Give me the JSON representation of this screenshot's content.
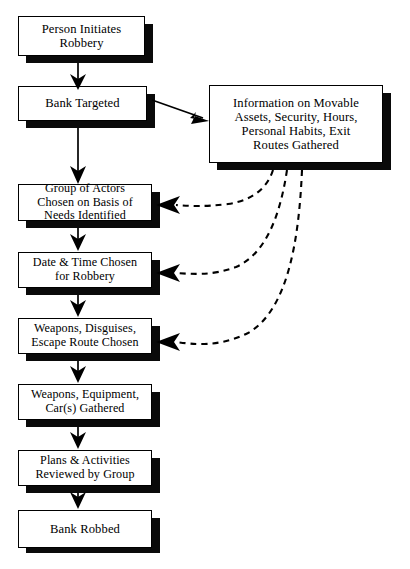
{
  "diagram": {
    "type": "flowchart",
    "colors": {
      "background": "#ffffff",
      "box_fill": "#ffffff",
      "box_border": "#000000",
      "shadow": "#0a0a0a",
      "line": "#000000"
    },
    "nodes": [
      {
        "id": "person-initiates",
        "label": "Person Initiates\nRobbery"
      },
      {
        "id": "bank-targeted",
        "label": "Bank Targeted"
      },
      {
        "id": "information-gathered",
        "label": "Information on Movable\nAssets, Security, Hours,\nPersonal Habits, Exit\nRoutes Gathered"
      },
      {
        "id": "group-of-actors",
        "label": "Group of Actors\nChosen on Basis of\nNeeds Identified"
      },
      {
        "id": "date-time-chosen",
        "label": "Date & Time Chosen\nfor Robbery"
      },
      {
        "id": "weapons-disguises",
        "label": "Weapons, Disguises,\nEscape Route Chosen"
      },
      {
        "id": "weapons-equipment",
        "label": "Weapons, Equipment,\nCar(s) Gathered"
      },
      {
        "id": "plans-reviewed",
        "label": "Plans & Activities\nReviewed by Group"
      },
      {
        "id": "bank-robbed",
        "label": "Bank Robbed"
      }
    ],
    "edges": [
      {
        "id": "e1",
        "from": "person-initiates",
        "to": "bank-targeted",
        "style": "solid"
      },
      {
        "id": "e2",
        "from": "bank-targeted",
        "to": "information-gathered",
        "style": "solid"
      },
      {
        "id": "e3",
        "from": "bank-targeted",
        "to": "group-of-actors",
        "style": "solid"
      },
      {
        "id": "e4",
        "from": "group-of-actors",
        "to": "date-time-chosen",
        "style": "solid"
      },
      {
        "id": "e5",
        "from": "date-time-chosen",
        "to": "weapons-disguises",
        "style": "solid"
      },
      {
        "id": "e6",
        "from": "weapons-disguises",
        "to": "weapons-equipment",
        "style": "solid"
      },
      {
        "id": "e7",
        "from": "weapons-equipment",
        "to": "plans-reviewed",
        "style": "solid"
      },
      {
        "id": "e8",
        "from": "plans-reviewed",
        "to": "bank-robbed",
        "style": "solid"
      },
      {
        "id": "e9",
        "from": "information-gathered",
        "to": "group-of-actors",
        "style": "dashed"
      },
      {
        "id": "e10",
        "from": "information-gathered",
        "to": "date-time-chosen",
        "style": "dashed"
      },
      {
        "id": "e11",
        "from": "information-gathered",
        "to": "weapons-disguises",
        "style": "dashed"
      }
    ]
  }
}
